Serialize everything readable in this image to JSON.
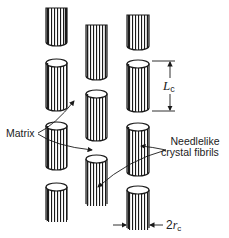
{
  "figure": {
    "background": "#ffffff",
    "ink_color": "#1a1a1a",
    "labels": {
      "matrix": "Matrix",
      "fibrils_line1": "Needlelike",
      "fibrils_line2": "crystal fibrils",
      "length_symbol": "L",
      "length_subscript": "c",
      "radius_prefix": "2",
      "radius_symbol": "r",
      "radius_subscript": "c"
    },
    "columns": [
      {
        "name": "left",
        "x": 46,
        "width": 21,
        "segments": [
          {
            "type": "stub-top",
            "y1": 8,
            "y2": 46
          },
          {
            "type": "cylinder",
            "y1": 59,
            "y2": 111
          },
          {
            "type": "cylinder",
            "y1": 122,
            "y2": 170
          },
          {
            "type": "stub-bottom",
            "y1": 183,
            "y2": 222
          }
        ]
      },
      {
        "name": "middle",
        "x": 86,
        "width": 21,
        "segments": [
          {
            "type": "stub-top",
            "y1": 25,
            "y2": 80
          },
          {
            "type": "cylinder",
            "y1": 90,
            "y2": 141
          },
          {
            "type": "stub-bottom",
            "y1": 155,
            "y2": 206
          }
        ]
      },
      {
        "name": "right",
        "x": 127,
        "width": 22,
        "segments": [
          {
            "type": "stub-top",
            "y1": 15,
            "y2": 50
          },
          {
            "type": "cylinder",
            "y1": 60,
            "y2": 112
          },
          {
            "type": "cylinder",
            "y1": 123,
            "y2": 176
          },
          {
            "type": "stub-bottom",
            "y1": 186,
            "y2": 230
          }
        ]
      }
    ]
  }
}
